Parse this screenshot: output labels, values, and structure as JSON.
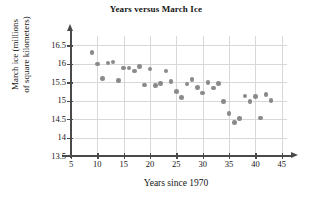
{
  "chart_data": {
    "type": "scatter",
    "title": "Years versus March Ice",
    "xlabel": "Years since 1970",
    "ylabel_line1": "March ice (millions",
    "ylabel_line2": "of square kilometers)",
    "xlim": [
      5,
      46
    ],
    "ylim": [
      13.5,
      16.75
    ],
    "xticks": [
      5,
      10,
      15,
      20,
      25,
      30,
      35,
      40,
      45
    ],
    "yticks": [
      "16.5",
      "16",
      "15.5",
      "15",
      "14.5",
      "14",
      "13.5"
    ],
    "ytick_values": [
      16.5,
      16,
      15.5,
      15,
      14.5,
      14,
      13.5
    ],
    "grid": true,
    "legend": "none",
    "marker_color": "#8a8a8a",
    "axis_color": "#4a4a4a",
    "grid_color": "#d8d8d8",
    "points": [
      {
        "x": 9,
        "y": 16.31
      },
      {
        "x": 10,
        "y": 15.99
      },
      {
        "x": 11,
        "y": 15.6
      },
      {
        "x": 12,
        "y": 16.02
      },
      {
        "x": 13,
        "y": 16.05
      },
      {
        "x": 14,
        "y": 15.55
      },
      {
        "x": 15,
        "y": 15.88
      },
      {
        "x": 16,
        "y": 15.88
      },
      {
        "x": 17,
        "y": 15.8
      },
      {
        "x": 18,
        "y": 15.93
      },
      {
        "x": 19,
        "y": 15.42
      },
      {
        "x": 20,
        "y": 15.86
      },
      {
        "x": 21,
        "y": 15.41
      },
      {
        "x": 22,
        "y": 15.47
      },
      {
        "x": 23,
        "y": 15.8
      },
      {
        "x": 24,
        "y": 15.52
      },
      {
        "x": 25,
        "y": 15.24
      },
      {
        "x": 26,
        "y": 15.09
      },
      {
        "x": 27,
        "y": 15.45
      },
      {
        "x": 28,
        "y": 15.57
      },
      {
        "x": 29,
        "y": 15.36
      },
      {
        "x": 30,
        "y": 15.21
      },
      {
        "x": 31,
        "y": 15.49
      },
      {
        "x": 32,
        "y": 15.34
      },
      {
        "x": 33,
        "y": 15.46
      },
      {
        "x": 34,
        "y": 14.98
      },
      {
        "x": 35,
        "y": 14.65
      },
      {
        "x": 36,
        "y": 14.41
      },
      {
        "x": 37,
        "y": 14.52
      },
      {
        "x": 38,
        "y": 15.13
      },
      {
        "x": 39,
        "y": 14.97
      },
      {
        "x": 40,
        "y": 15.11
      },
      {
        "x": 41,
        "y": 14.53
      },
      {
        "x": 42,
        "y": 15.16
      },
      {
        "x": 43,
        "y": 15.0
      }
    ]
  }
}
